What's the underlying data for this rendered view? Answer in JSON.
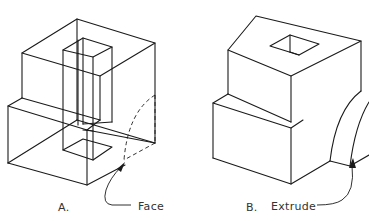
{
  "figure": {
    "type": "technical-isometric-drawing",
    "colors": {
      "line": "#1a1a1a",
      "text": "#333333",
      "background": "#ffffff"
    },
    "panels": [
      {
        "id": "A",
        "label": "A.",
        "callout": "Face",
        "description": "Wireframe isometric block with vertical rectangular through-hole; dashed quarter-arc profile sketched on right face"
      },
      {
        "id": "B",
        "label": "B.",
        "callout": "Extrude",
        "description": "Solid isometric stepped block with square hole on top; curved extruded feature on right side"
      }
    ]
  }
}
